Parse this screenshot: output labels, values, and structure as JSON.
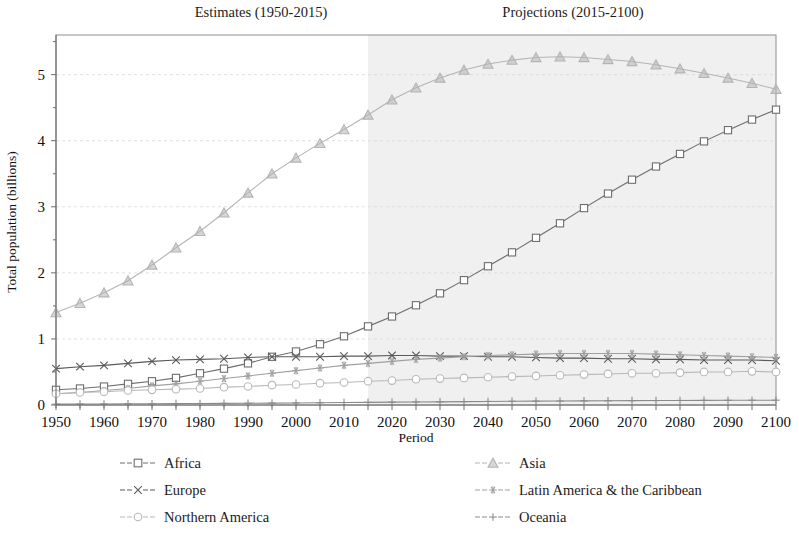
{
  "annotations": {
    "estimates_label": "Estimates (1950-2015)",
    "projections_label": "Projections (2015-2100)"
  },
  "axes": {
    "x_title": "Period",
    "y_title": "Total population (billions)",
    "x_ticks": [
      "1950",
      "1960",
      "1970",
      "1980",
      "1990",
      "2000",
      "2010",
      "2020",
      "2030",
      "2040",
      "2050",
      "2060",
      "2070",
      "2080",
      "2090",
      "2100"
    ],
    "y_ticks": [
      "0",
      "1",
      "2",
      "3",
      "4",
      "5"
    ]
  },
  "legend": {
    "items": [
      {
        "label": "Africa",
        "marker": "square-icon",
        "color": "#6e6e6e",
        "column": 1
      },
      {
        "label": "Asia",
        "marker": "triangle-icon",
        "color": "#b4b4b4",
        "column": 2
      },
      {
        "label": "Europe",
        "marker": "x-cross-icon",
        "color": "#5a5a5a",
        "column": 1
      },
      {
        "label": "Latin America & the Caribbean",
        "marker": "asterisk-icon",
        "color": "#a0a0a0",
        "column": 2
      },
      {
        "label": "Northern America",
        "marker": "circle-icon",
        "color": "#b8b8b8",
        "column": 1
      },
      {
        "label": "Oceania",
        "marker": "plus-icon",
        "color": "#8a8a8a",
        "column": 2
      }
    ]
  },
  "chart_data": {
    "type": "line",
    "title": "",
    "xlabel": "Period",
    "ylabel": "Total population (billions)",
    "xlim": [
      1950,
      2100
    ],
    "ylim": [
      0,
      5.6
    ],
    "grid": true,
    "legend_position": "bottom",
    "shaded_region": {
      "label": "Projections (2015-2100)",
      "x_start": 2015,
      "x_end": 2100,
      "color": "#f0f0f0"
    },
    "x": [
      1950,
      1955,
      1960,
      1965,
      1970,
      1975,
      1980,
      1985,
      1990,
      1995,
      2000,
      2005,
      2010,
      2015,
      2020,
      2025,
      2030,
      2035,
      2040,
      2045,
      2050,
      2055,
      2060,
      2065,
      2070,
      2075,
      2080,
      2085,
      2090,
      2095,
      2100
    ],
    "series": [
      {
        "name": "Africa",
        "marker": "square-icon",
        "color": "#6e6e6e",
        "values": [
          0.23,
          0.25,
          0.28,
          0.32,
          0.36,
          0.41,
          0.48,
          0.55,
          0.63,
          0.73,
          0.81,
          0.92,
          1.04,
          1.19,
          1.34,
          1.51,
          1.69,
          1.89,
          2.1,
          2.31,
          2.53,
          2.75,
          2.98,
          3.2,
          3.41,
          3.61,
          3.8,
          3.99,
          4.16,
          4.32,
          4.47
        ]
      },
      {
        "name": "Asia",
        "marker": "triangle-icon",
        "color": "#b4b4b4",
        "values": [
          1.4,
          1.54,
          1.7,
          1.88,
          2.12,
          2.38,
          2.63,
          2.91,
          3.21,
          3.5,
          3.74,
          3.96,
          4.17,
          4.39,
          4.62,
          4.8,
          4.95,
          5.07,
          5.16,
          5.22,
          5.26,
          5.27,
          5.26,
          5.23,
          5.2,
          5.15,
          5.09,
          5.02,
          4.95,
          4.87,
          4.78
        ]
      },
      {
        "name": "Europe",
        "marker": "x-cross-icon",
        "color": "#5a5a5a",
        "values": [
          0.55,
          0.58,
          0.6,
          0.63,
          0.66,
          0.68,
          0.69,
          0.7,
          0.72,
          0.73,
          0.73,
          0.73,
          0.74,
          0.74,
          0.75,
          0.75,
          0.74,
          0.74,
          0.73,
          0.73,
          0.72,
          0.71,
          0.71,
          0.7,
          0.7,
          0.69,
          0.69,
          0.68,
          0.68,
          0.68,
          0.67
        ]
      },
      {
        "name": "Latin America & the Caribbean",
        "marker": "asterisk-icon",
        "color": "#a0a0a0",
        "values": [
          0.17,
          0.19,
          0.22,
          0.25,
          0.29,
          0.32,
          0.36,
          0.4,
          0.44,
          0.48,
          0.52,
          0.56,
          0.6,
          0.63,
          0.66,
          0.69,
          0.71,
          0.73,
          0.75,
          0.76,
          0.77,
          0.78,
          0.78,
          0.78,
          0.78,
          0.77,
          0.76,
          0.75,
          0.74,
          0.73,
          0.72
        ]
      },
      {
        "name": "Northern America",
        "marker": "circle-icon",
        "color": "#b8b8b8",
        "values": [
          0.17,
          0.19,
          0.2,
          0.22,
          0.23,
          0.24,
          0.25,
          0.27,
          0.28,
          0.3,
          0.31,
          0.33,
          0.34,
          0.36,
          0.37,
          0.39,
          0.4,
          0.41,
          0.42,
          0.43,
          0.44,
          0.45,
          0.46,
          0.47,
          0.48,
          0.48,
          0.49,
          0.5,
          0.5,
          0.51,
          0.5
        ]
      },
      {
        "name": "Oceania",
        "marker": "plus-icon",
        "color": "#8a8a8a",
        "values": [
          0.013,
          0.014,
          0.016,
          0.018,
          0.02,
          0.021,
          0.023,
          0.025,
          0.027,
          0.029,
          0.031,
          0.033,
          0.037,
          0.04,
          0.043,
          0.046,
          0.048,
          0.051,
          0.054,
          0.056,
          0.058,
          0.06,
          0.062,
          0.064,
          0.066,
          0.067,
          0.069,
          0.07,
          0.071,
          0.072,
          0.073
        ]
      }
    ]
  }
}
